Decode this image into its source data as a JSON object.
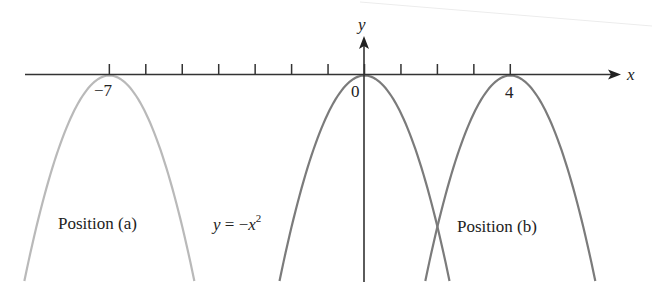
{
  "figure": {
    "axes": {
      "x_label": "x",
      "y_label": "y",
      "x_range": [
        -9.3,
        7.5
      ],
      "tick_positions": [
        -7,
        -6,
        -5,
        -4,
        -3,
        -2,
        -1,
        0,
        1,
        2,
        3,
        4
      ],
      "tick_labels": [
        {
          "value": -7,
          "text": "−7"
        },
        {
          "value": 0,
          "text": "0"
        },
        {
          "value": 4,
          "text": "4"
        }
      ]
    },
    "curves": [
      {
        "name": "position-a",
        "vertex_x": -7,
        "color": "#b9b9b9"
      },
      {
        "name": "base",
        "vertex_x": 0,
        "color": "#7b7b7b"
      },
      {
        "name": "position-b",
        "vertex_x": 4,
        "color": "#7b7b7b"
      }
    ],
    "labels": {
      "position_a": "Position (a)",
      "position_b": "Position (b)",
      "equation_lhs": "y",
      "equation_mid": " = −",
      "equation_var": "x",
      "equation_exp": "2"
    }
  },
  "chart_data": {
    "type": "line",
    "title": "",
    "xlabel": "x",
    "ylabel": "y",
    "series": [
      {
        "name": "Position (a): y = -(x+7)^2",
        "vertex": [
          -7,
          0
        ]
      },
      {
        "name": "y = -x^2",
        "vertex": [
          0,
          0
        ]
      },
      {
        "name": "Position (b): y = -(x-4)^2",
        "vertex": [
          4,
          0
        ]
      }
    ],
    "x_ticks": [
      -7,
      -6,
      -5,
      -4,
      -3,
      -2,
      -1,
      0,
      1,
      2,
      3,
      4
    ],
    "labeled_ticks": [
      -7,
      0,
      4
    ],
    "grid": false
  }
}
